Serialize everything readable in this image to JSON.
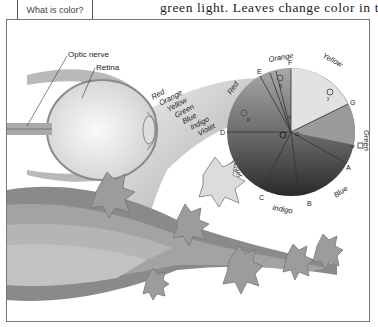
{
  "caption_box": {
    "label": "What is color?"
  },
  "body_text": "green light. Leaves change color in the fall",
  "figure": {
    "eye_labels": {
      "optic_nerve": "Optic nerve",
      "retina": "Retina"
    },
    "spectrum_labels": [
      "Red",
      "Orange",
      "Yellow",
      "Green",
      "Blue",
      "Indigo",
      "Violet"
    ],
    "wheel": {
      "color_names": {
        "red": "Red",
        "orange": "Orange",
        "yellow": "Yellow",
        "green": "Green",
        "blue": "Blue",
        "indigo": "Indigo",
        "violet": "Violet"
      },
      "point_letters": [
        "A",
        "B",
        "C",
        "D",
        "E",
        "F",
        "G"
      ],
      "inner_letters": {
        "center": "O",
        "y": "y",
        "q": "q",
        "p": "p",
        "r": "r",
        "z": "z",
        "w": "w",
        "t": "t"
      }
    }
  }
}
